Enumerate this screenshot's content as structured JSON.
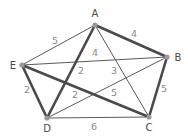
{
  "diagram": {
    "type": "weighted-graph",
    "nodes": [
      {
        "id": "A",
        "label": "A",
        "x": 95,
        "y": 25,
        "lx": 95,
        "ly": 17
      },
      {
        "id": "B",
        "label": "B",
        "x": 167,
        "y": 57,
        "lx": 178,
        "ly": 61
      },
      {
        "id": "C",
        "label": "C",
        "x": 149,
        "y": 117,
        "lx": 149,
        "ly": 131
      },
      {
        "id": "D",
        "label": "D",
        "x": 47,
        "y": 118,
        "lx": 47,
        "ly": 132
      },
      {
        "id": "E",
        "label": "E",
        "x": 22,
        "y": 65,
        "lx": 13,
        "ly": 69
      }
    ],
    "edges": [
      {
        "from": "A",
        "to": "E",
        "weight": "5",
        "highlighted": false,
        "lx": 55,
        "ly": 44
      },
      {
        "from": "A",
        "to": "B",
        "weight": "4",
        "highlighted": true,
        "lx": 134,
        "ly": 37
      },
      {
        "from": "E",
        "to": "B",
        "weight": "4",
        "highlighted": false,
        "lx": 95,
        "ly": 56
      },
      {
        "from": "A",
        "to": "D",
        "weight": "2",
        "highlighted": true,
        "lx": 81,
        "ly": 74
      },
      {
        "from": "A",
        "to": "C",
        "weight": "3",
        "highlighted": false,
        "lx": 114,
        "ly": 74
      },
      {
        "from": "E",
        "to": "D",
        "weight": "2",
        "highlighted": true,
        "lx": 27,
        "ly": 93
      },
      {
        "from": "E",
        "to": "C",
        "weight": "2",
        "highlighted": true,
        "lx": 75,
        "ly": 98
      },
      {
        "from": "D",
        "to": "B",
        "weight": "5",
        "highlighted": false,
        "lx": 114,
        "ly": 96
      },
      {
        "from": "B",
        "to": "C",
        "weight": "5",
        "highlighted": true,
        "lx": 164,
        "ly": 92
      },
      {
        "from": "D",
        "to": "C",
        "weight": "6",
        "highlighted": false,
        "lx": 94,
        "ly": 130
      }
    ]
  }
}
